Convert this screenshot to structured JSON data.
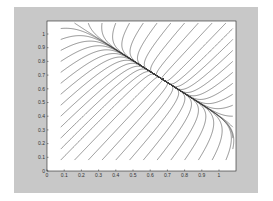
{
  "chart_data": {
    "type": "line",
    "subtype": "phase-portrait-streamlines",
    "title": "",
    "xlabel": "",
    "ylabel": "",
    "xlim": [
      0,
      1.1
    ],
    "ylim": [
      0,
      1.1
    ],
    "grid": false,
    "legend": null,
    "x_ticks": [
      "0",
      "0.1",
      "0.2",
      "0.3",
      "0.4",
      "0.5",
      "0.6",
      "0.7",
      "0.8",
      "0.9",
      "1"
    ],
    "y_ticks": [
      "0",
      "0.1",
      "0.2",
      "0.3",
      "0.4",
      "0.5",
      "0.6",
      "0.7",
      "0.8",
      "0.9",
      "1"
    ],
    "equilibrium": {
      "x": 0.67,
      "y": 0.67,
      "type": "stable node"
    },
    "trajectory_starts": {
      "left_edge_x": 0.08,
      "bottom_edge_y": 0.08,
      "top_edge_y": 1.08,
      "right_edge_x": 1.08,
      "spacing": 0.08
    },
    "dynamics": {
      "fast_eigenvalue": -3.0,
      "slow_eigenvalue": -0.35,
      "fast_direction": [
        0.75,
        1.0
      ],
      "slow_direction": [
        1.0,
        -0.8
      ]
    }
  },
  "colors": {
    "figure_background": "#c8c8c8",
    "axes_background": "#ffffff",
    "line": "#3a3a3a",
    "axis": "#222222"
  }
}
